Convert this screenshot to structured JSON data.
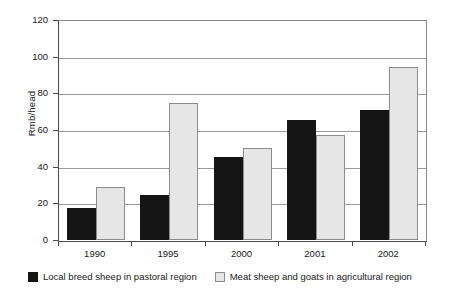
{
  "chart_data": {
    "type": "bar",
    "title": "",
    "subtitle": "",
    "xlabel": "",
    "ylabel": "Rmb/head",
    "categories": [
      "1990",
      "1995",
      "2000",
      "2001",
      "2002"
    ],
    "series": [
      {
        "name": "Local breed sheep in pastoral region",
        "color": "#151515",
        "values": [
          17.5,
          24.5,
          45.5,
          65.5,
          71.5
        ]
      },
      {
        "name": "Meat sheep and goats in agricultural region",
        "color": "#e6e6e6",
        "values": [
          29,
          75,
          50.5,
          57.5,
          95
        ]
      }
    ],
    "ylim": [
      0,
      120
    ],
    "ytick_labels": [
      "120",
      "100",
      "80",
      "60",
      "40",
      "20",
      "0"
    ],
    "ytick_values": [
      120,
      100,
      80,
      60,
      40,
      20,
      0
    ],
    "grid": true,
    "grid_axis": "y",
    "legend_position": "bottom"
  },
  "legend": {
    "entries": [
      {
        "label": "Local breed sheep in pastoral region",
        "swatch": "dark"
      },
      {
        "label": "Meat sheep and goats in agricultural region",
        "swatch": "light"
      }
    ]
  }
}
